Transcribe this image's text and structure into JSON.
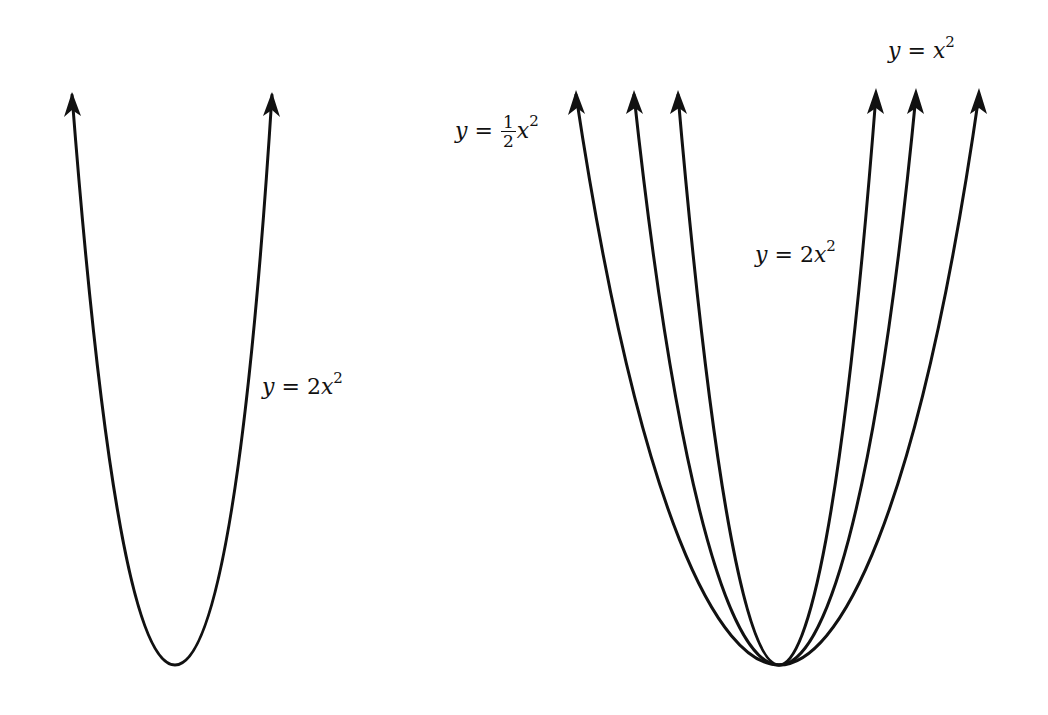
{
  "figure": {
    "left_panel": {
      "curves": [
        {
          "equation": "y = 2x^2",
          "label": {
            "var": "y",
            "eq": "=",
            "coef": "2",
            "x": "x",
            "exp": "2"
          }
        }
      ]
    },
    "right_panel": {
      "curves": [
        {
          "equation": "y = 1/2 x^2",
          "label": {
            "var": "y",
            "eq": "=",
            "num": "1",
            "den": "2",
            "x": "x",
            "exp": "2"
          }
        },
        {
          "equation": "y = x^2",
          "label": {
            "var": "y",
            "eq": "=",
            "x": "x",
            "exp": "2"
          }
        },
        {
          "equation": "y = 2x^2",
          "label": {
            "var": "y",
            "eq": "=",
            "coef": "2",
            "x": "x",
            "exp": "2"
          }
        }
      ]
    },
    "stroke_color": "#111111",
    "background": "#ffffff"
  }
}
